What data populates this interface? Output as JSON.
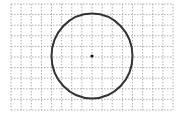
{
  "diagram": {
    "type": "circle-on-grid",
    "grid": {
      "x0": 11,
      "y0": 4,
      "x1": 173,
      "y1": 110,
      "cols": 16,
      "rows": 10,
      "color": "#9a9a9a",
      "style": "dashed"
    },
    "circle": {
      "cx": 92,
      "cy": 56,
      "rx": 40.5,
      "ry": 42.5,
      "stroke": "#333333",
      "stroke_width": 2
    },
    "center_point": {
      "cx": 92,
      "cy": 56,
      "r": 1.6,
      "fill": "#111111"
    }
  }
}
